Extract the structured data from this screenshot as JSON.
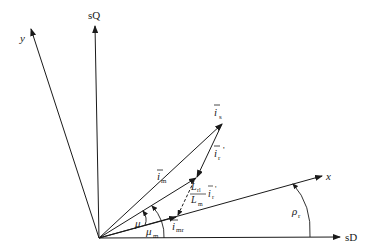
{
  "diagram": {
    "type": "space-phasor vector diagram",
    "axes": {
      "sD": {
        "label": "sD"
      },
      "sQ": {
        "label": "sQ"
      },
      "x": {
        "label": "x"
      },
      "y": {
        "label": "y"
      }
    },
    "vectors": {
      "is": {
        "label": "i",
        "sub": "s"
      },
      "ir_prime": {
        "label": "i",
        "sub": "r",
        "prime": "'"
      },
      "im": {
        "label": "i",
        "sub": "m"
      },
      "imr": {
        "label": "i",
        "sub": "mr"
      },
      "scaled_ir": {
        "num": "L",
        "num_sub": "rl",
        "den": "L",
        "den_sub": "m",
        "vec": "i",
        "vec_sub": "r",
        "prime": "'"
      }
    },
    "angles": {
      "mu": {
        "label": "μ"
      },
      "mu_m": {
        "label": "μ",
        "sub": "m"
      },
      "rho_r": {
        "label": "ρ",
        "sub": "r"
      }
    },
    "colors": {
      "ink": "#1a1a1a",
      "background": "#ffffff"
    }
  }
}
